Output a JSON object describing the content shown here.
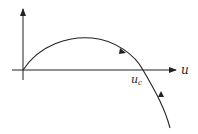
{
  "diagram": {
    "x_axis_label": "u",
    "critical_point_label": "u",
    "critical_point_subscript": "c",
    "curve_description": "trajectory rising from origin, peaking, crossing the u-axis at u_c, and descending below",
    "arrows": [
      "forward along upper arc toward u_c",
      "upward along lower branch toward u_c"
    ],
    "colors": {
      "stroke": "#222222",
      "background": "#ffffff"
    }
  }
}
